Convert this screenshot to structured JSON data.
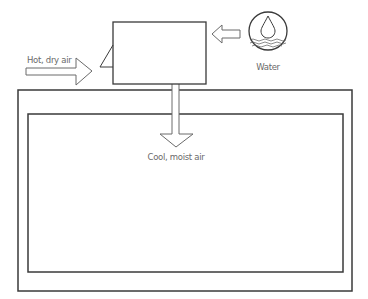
{
  "diagram": {
    "type": "evaporative-cooler-schematic",
    "labels": {
      "hot_air": "Hot, dry air",
      "water": "Water",
      "cool_air": "Cool, moist air"
    },
    "colors": {
      "stroke": "#3a3a3a",
      "arrow_stroke": "#6a6a6a",
      "text": "#6a6a6a",
      "background": "#ffffff"
    },
    "components": [
      {
        "id": "cooler-unit",
        "shape": "rectangle"
      },
      {
        "id": "hot-air-arrow",
        "direction": "right"
      },
      {
        "id": "water-arrow",
        "direction": "left"
      },
      {
        "id": "water-icon",
        "shape": "circle-with-droplet-and-waves"
      },
      {
        "id": "cool-air-arrow",
        "direction": "down"
      },
      {
        "id": "room-outer-wall",
        "shape": "rectangle"
      },
      {
        "id": "room-inner-wall",
        "shape": "rectangle"
      }
    ]
  }
}
